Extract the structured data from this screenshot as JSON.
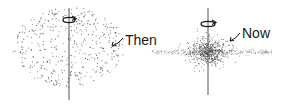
{
  "diagram": {
    "panels": [
      {
        "id": "then",
        "label": "Then",
        "description": "diffuse rotating spherical cloud",
        "center": [
          69,
          47
        ],
        "radius": [
          56,
          40
        ],
        "axis": {
          "x": 69,
          "y1": 8,
          "y2": 100
        },
        "rotation_arrow_y": 20,
        "label_pos": [
          125,
          45
        ],
        "arrow_from": [
          123,
          38
        ],
        "arrow_to": [
          112,
          46
        ],
        "dot_count": 420
      },
      {
        "id": "now",
        "label": "Now",
        "description": "collapsed flattened disk with central bulge",
        "center": [
          208,
          52
        ],
        "bulge_radius": [
          22,
          18
        ],
        "disk_extent": [
          152,
          272
        ],
        "axis": {
          "x": 208,
          "y1": 8,
          "y2": 95
        },
        "rotation_arrow_y": 24,
        "label_pos": [
          242,
          38
        ],
        "arrow_from": [
          240,
          33
        ],
        "arrow_to": [
          230,
          41
        ],
        "dot_count": 900
      }
    ],
    "colors": {
      "ink": "#1a1a1a",
      "dot": "#3a3a3a",
      "axis": "#555555",
      "background": "#ffffff"
    }
  }
}
